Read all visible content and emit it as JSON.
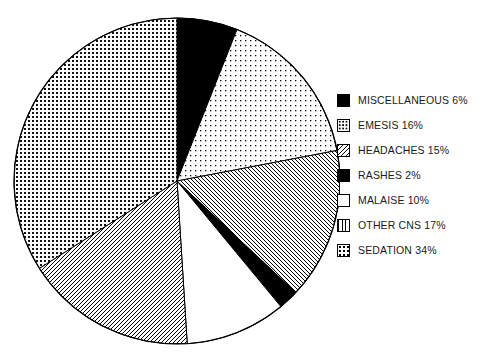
{
  "chart_data": {
    "type": "pie",
    "title": "",
    "categories": [
      "MISCELLANEOUS",
      "EMESIS",
      "HEADACHES",
      "RASHES",
      "MALAISE",
      "OTHER CNS",
      "SEDATION"
    ],
    "values": [
      6,
      16,
      15,
      2,
      10,
      17,
      34
    ],
    "value_unit": "%",
    "start_angle_deg": 0,
    "direction": "clockwise",
    "legend_position": "right",
    "grid": false,
    "slices": [
      {
        "label": "MISCELLANEOUS",
        "value": 6,
        "legend_text": "MISCELLANEOUS 6%",
        "fill": "solid-black",
        "color": "#000000"
      },
      {
        "label": "EMESIS",
        "value": 16,
        "legend_text": "EMESIS 16%",
        "fill": "sparse-dots",
        "color": "#000000"
      },
      {
        "label": "HEADACHES",
        "value": 15,
        "legend_text": "HEADACHES 15%",
        "fill": "diagonal-backslash",
        "color": "#000000"
      },
      {
        "label": "RASHES",
        "value": 2,
        "legend_text": "RASHES 2%",
        "fill": "solid-black",
        "color": "#000000"
      },
      {
        "label": "MALAISE",
        "value": 10,
        "legend_text": "MALAISE 10%",
        "fill": "white",
        "color": "#ffffff"
      },
      {
        "label": "OTHER CNS",
        "value": 17,
        "legend_text": "OTHER CNS 17%",
        "fill": "diagonal-slash",
        "color": "#000000"
      },
      {
        "label": "SEDATION",
        "value": 34,
        "legend_text": "SEDATION 34%",
        "fill": "dense-checker-dots",
        "color": "#000000"
      }
    ]
  },
  "legend": {
    "items": [
      {
        "text": "MISCELLANEOUS 6%"
      },
      {
        "text": "EMESIS 16%"
      },
      {
        "text": "HEADACHES 15%"
      },
      {
        "text": "RASHES 2%"
      },
      {
        "text": "MALAISE 10%"
      },
      {
        "text": "OTHER CNS 17%"
      },
      {
        "text": "SEDATION 34%"
      }
    ]
  },
  "colors": {
    "outline": "#000000",
    "background": "#ffffff",
    "text": "#1a1a1a"
  }
}
